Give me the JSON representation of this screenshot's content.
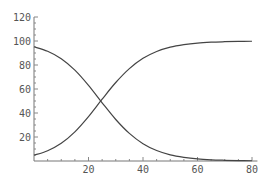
{
  "chart_data": {
    "type": "line",
    "title": "",
    "xlabel": "",
    "ylabel": "",
    "xlim": [
      0,
      82
    ],
    "ylim": [
      0,
      120
    ],
    "grid": false,
    "legend": null,
    "x_ticks": [
      20,
      40,
      60,
      80
    ],
    "y_ticks": [
      20,
      40,
      60,
      80,
      100,
      120
    ],
    "x_tick_labels": [
      "20",
      "40",
      "60",
      "80"
    ],
    "y_tick_labels": [
      "20",
      "40",
      "60",
      "80",
      "100",
      "120"
    ],
    "x": [
      0,
      5,
      10,
      15,
      20,
      25,
      30,
      35,
      40,
      45,
      50,
      55,
      60,
      65,
      70,
      75,
      80
    ],
    "series": [
      {
        "name": "rising",
        "values": [
          4.8,
          8.6,
          14.8,
          24.3,
          37.0,
          51.5,
          65.4,
          77.0,
          85.6,
          91.3,
          94.9,
          97.0,
          98.3,
          99.0,
          99.4,
          99.7,
          99.8
        ]
      },
      {
        "name": "falling",
        "values": [
          95.2,
          91.4,
          85.2,
          75.7,
          63.0,
          48.5,
          34.6,
          23.0,
          14.4,
          8.7,
          5.1,
          3.0,
          1.7,
          1.0,
          0.6,
          0.3,
          0.2
        ]
      }
    ]
  },
  "colors": {
    "curve": "#444444",
    "axis": "#777777",
    "label": "#555555",
    "background": "#ffffff"
  }
}
